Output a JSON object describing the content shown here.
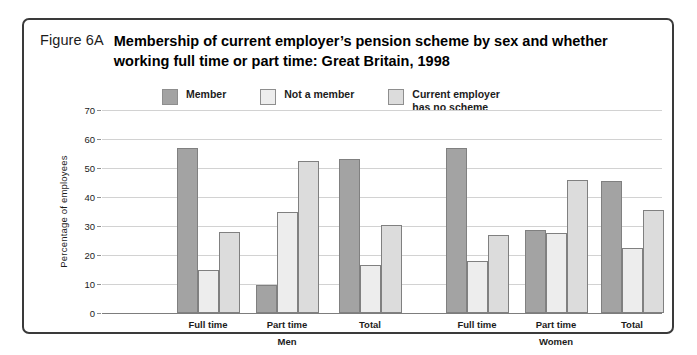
{
  "figure": {
    "number": "Figure 6A",
    "title": "Membership of current employer’s pension scheme by sex and whether working full time or part time:  Great Britain, 1998"
  },
  "chart_data": {
    "type": "bar",
    "title": "Membership of current employer’s pension scheme by sex and whether working full time or part time:  Great Britain, 1998",
    "xlabel": "",
    "ylabel": "Percentage of employees",
    "ylim": [
      0,
      70
    ],
    "ytick_step": 10,
    "yticks": [
      0,
      10,
      20,
      30,
      40,
      50,
      60,
      70
    ],
    "grid": true,
    "legend_position": "top-center",
    "group_labels": [
      "Men",
      "Women"
    ],
    "categories": [
      "Full time",
      "Part time",
      "Total",
      "Full time",
      "Part time",
      "Total"
    ],
    "series": [
      {
        "name": "Member",
        "color": "#a3a3a3",
        "values": [
          57,
          9.5,
          53,
          57,
          28.5,
          45.5
        ]
      },
      {
        "name": "Not a member",
        "color": "#ededed",
        "values": [
          15,
          35,
          16.5,
          18,
          27.5,
          22.5
        ]
      },
      {
        "name": "Current employer\nhas no scheme",
        "color": "#dcdcdc",
        "values": [
          28,
          52.5,
          30.5,
          27,
          46,
          35.5
        ]
      }
    ]
  }
}
